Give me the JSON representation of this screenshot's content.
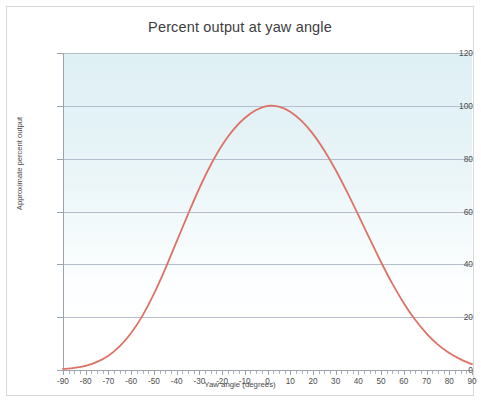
{
  "chart_data": {
    "type": "line",
    "title": "Percent output at yaw angle",
    "xlabel": "Yaw angle (degrees)",
    "ylabel": "Approximate percent output",
    "xlim": [
      -90,
      90
    ],
    "ylim": [
      0,
      120
    ],
    "grid": true,
    "legend": null,
    "legend_position": "none",
    "line_color": "#dd7266",
    "plot_background": "#e3f2f6",
    "gridline_color": "#b4bfcd",
    "x_ticks": [
      -90,
      -80,
      -70,
      -60,
      -50,
      -40,
      -30,
      -20,
      -10,
      0,
      10,
      20,
      30,
      40,
      50,
      60,
      70,
      80,
      90
    ],
    "x_tick_labels": [
      "-90",
      "-80",
      "-70",
      "-60",
      "-50",
      "-40",
      "-30",
      "-20",
      "-10",
      "0",
      "10",
      "20",
      "30",
      "40",
      "50",
      "60",
      "70",
      "80",
      "90"
    ],
    "y_ticks": [
      0,
      20,
      40,
      60,
      80,
      100,
      120
    ],
    "y_tick_labels": [
      "0",
      "20",
      "40",
      "60",
      "80",
      "100",
      "120"
    ],
    "series": [
      {
        "name": "Approximate percent output",
        "x": [
          -90,
          -85,
          -80,
          -75,
          -70,
          -65,
          -60,
          -55,
          -50,
          -45,
          -40,
          -35,
          -30,
          -25,
          -20,
          -15,
          -10,
          -5,
          0,
          5,
          10,
          15,
          20,
          25,
          30,
          35,
          40,
          45,
          50,
          55,
          60,
          65,
          70,
          75,
          80,
          85,
          90
        ],
        "values": [
          0.4,
          0.8,
          1.6,
          3.1,
          5.4,
          9.0,
          14.0,
          20.6,
          28.8,
          38.3,
          48.6,
          58.9,
          68.8,
          77.6,
          85.1,
          91.0,
          95.4,
          98.4,
          100.0,
          99.7,
          97.8,
          94.3,
          89.4,
          83.1,
          75.7,
          67.4,
          58.6,
          49.6,
          40.8,
          32.6,
          25.3,
          19.0,
          13.8,
          9.6,
          6.4,
          4.0,
          2.2
        ]
      }
    ]
  }
}
